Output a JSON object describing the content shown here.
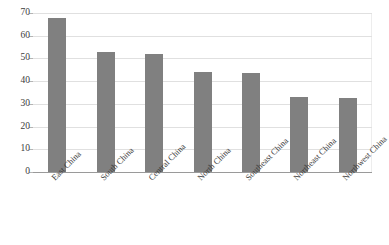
{
  "chart_data": {
    "type": "bar",
    "title": "",
    "xlabel": "",
    "ylabel": "",
    "categories": [
      "East China",
      "South China",
      "Central China",
      "North China",
      "Southeast China",
      "Northeast China",
      "Northwest China"
    ],
    "values": [
      68,
      53,
      52,
      44,
      43.5,
      33,
      32.5
    ],
    "ylim": [
      0,
      70
    ],
    "yticks": [
      0,
      10,
      20,
      30,
      40,
      50,
      60,
      70
    ],
    "ytick_labels": [
      "0",
      "10",
      "20",
      "30",
      "40",
      "50",
      "60",
      "70"
    ],
    "grid": true,
    "legend": false,
    "series": [
      {
        "name": "",
        "values": [
          68,
          53,
          52,
          44,
          43.5,
          33,
          32.5
        ],
        "color": "#808080"
      }
    ]
  },
  "style": {
    "bar_color": "#808080",
    "grid_color": "#e0e0e0",
    "axis_color": "#9a9a9a",
    "text_color": "#3b3b3b",
    "background": "#ffffff"
  }
}
